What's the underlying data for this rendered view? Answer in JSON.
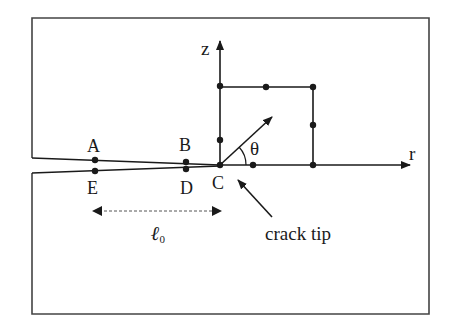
{
  "diagram": {
    "labels": {
      "z_axis": "z",
      "r_axis": "r",
      "theta": "θ",
      "point_a": "A",
      "point_b": "B",
      "point_c": "C",
      "point_d": "D",
      "point_e": "E",
      "length_symbol": "ℓ",
      "length_subscript": "0",
      "crack_tip": "crack tip"
    },
    "colors": {
      "line": "#1a1a1a",
      "frame": "#444444",
      "background": "#ffffff"
    }
  }
}
